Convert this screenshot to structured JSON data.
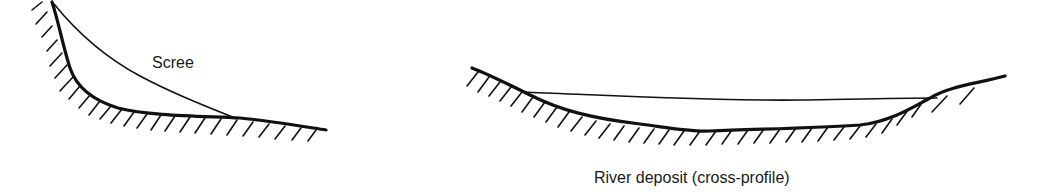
{
  "diagram": {
    "panels": [
      {
        "id": "scree",
        "label": "Scree",
        "description": "Scree deposit at base of a steep slope"
      },
      {
        "id": "river",
        "label": "River deposit (cross-profile)",
        "description": "River deposit filling a valley cross-profile"
      }
    ],
    "colors": {
      "ink": "#111111",
      "background": "#ffffff"
    }
  }
}
